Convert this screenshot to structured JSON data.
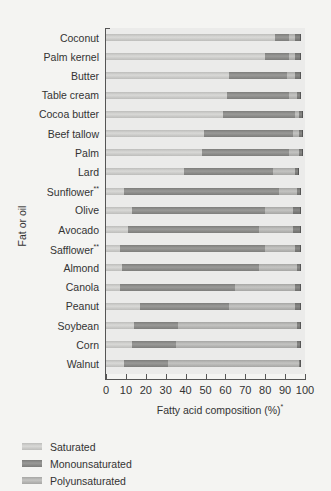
{
  "chart_data": {
    "type": "bar",
    "orientation": "horizontal",
    "stacked": true,
    "title": "",
    "xlabel": "Fatty acid composition (%)*",
    "ylabel": "Fat or oil",
    "xlim": [
      0,
      100
    ],
    "xticks": [
      0,
      10,
      20,
      30,
      40,
      50,
      60,
      70,
      80,
      90,
      100
    ],
    "grid": false,
    "legend_position": "bottom-left",
    "categories": [
      "Coconut",
      "Palm kernel",
      "Butter",
      "Table cream",
      "Cocoa butter",
      "Beef tallow",
      "Palm",
      "Lard",
      "Sunflower**",
      "Olive",
      "Avocado",
      "Safflower**",
      "Almond",
      "Canola",
      "Peanut",
      "Soybean",
      "Corn",
      "Walnut"
    ],
    "series": [
      {
        "name": "Saturated",
        "values": [
          85,
          80,
          62,
          61,
          59,
          49,
          48,
          39,
          9,
          13,
          11,
          7,
          8,
          7,
          17,
          14,
          13,
          9
        ]
      },
      {
        "name": "Monounsaturated",
        "values": [
          7,
          12,
          29,
          31,
          36,
          45,
          44,
          45,
          78,
          67,
          66,
          73,
          69,
          58,
          45,
          22,
          22,
          22
        ]
      },
      {
        "name": "Polyunsaturated",
        "values": [
          3,
          3,
          4,
          4,
          2,
          3,
          5,
          11,
          9,
          14,
          17,
          15,
          19,
          30,
          33,
          60,
          61,
          66
        ]
      },
      {
        "name": "Other",
        "values": [
          3,
          3,
          3,
          2,
          2,
          2,
          2,
          2,
          2,
          4,
          4,
          3,
          2,
          3,
          3,
          2,
          2,
          1
        ]
      }
    ],
    "legend": [
      "Saturated",
      "Monounsaturated",
      "Polyunsaturated"
    ]
  },
  "axis": {
    "xlabel_text": "Fatty acid composition (%)",
    "xlabel_sup": "*",
    "ylabel": "Fat or oil"
  },
  "legend": {
    "items": [
      {
        "label": "Saturated"
      },
      {
        "label": "Monounsaturated"
      },
      {
        "label": "Polyunsaturated"
      }
    ]
  },
  "colors": {
    "saturated": "#cdcdcb",
    "monounsaturated": "#8a8a88",
    "polyunsaturated": "#b5b5b3",
    "other": "#7a7a78"
  }
}
